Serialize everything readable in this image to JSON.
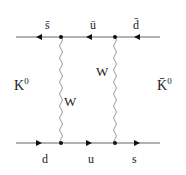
{
  "diagram": {
    "line_color": "#999999",
    "text_color": "#222222",
    "top_line": {
      "labels": [
        "s̄",
        "ū",
        "d̄"
      ],
      "arrow_direction": "left"
    },
    "bottom_line": {
      "labels": [
        "d",
        "u",
        "s"
      ],
      "arrow_direction": "right"
    },
    "bosons": [
      {
        "label": "W"
      },
      {
        "label": "W"
      }
    ],
    "left_state": {
      "label": "K",
      "superscript": "0"
    },
    "right_state": {
      "label": "K̄",
      "superscript": "0"
    }
  }
}
